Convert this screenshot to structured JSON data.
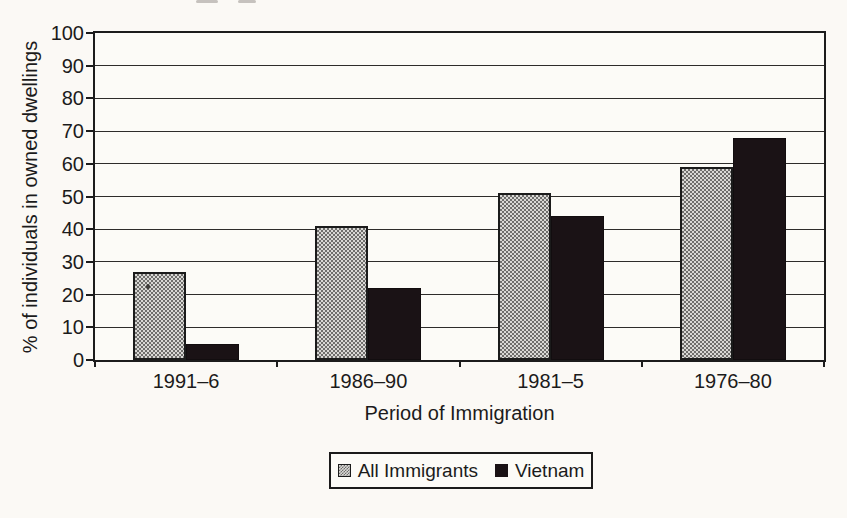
{
  "chart_data": {
    "type": "bar",
    "title": "",
    "categories": [
      "1991–6",
      "1986–90",
      "1981–5",
      "1976–80"
    ],
    "series": [
      {
        "name": "All Immigrants",
        "values": [
          27,
          41,
          51,
          59
        ],
        "style": "gray-checkerboard",
        "color": "#aaa8a5"
      },
      {
        "name": "Vietnam",
        "values": [
          5,
          22,
          44,
          68
        ],
        "style": "solid-black",
        "color": "#1a1215"
      }
    ],
    "xlabel": "Period of Immigration",
    "ylabel": "% of individuals in owned dwellings",
    "ylim": [
      0,
      100
    ],
    "ytick_step": 10,
    "ytick_labels": [
      "0",
      "10",
      "20",
      "30",
      "40",
      "50",
      "60",
      "70",
      "80",
      "90",
      "100"
    ],
    "grid": "horizontal",
    "legend_position": "bottom-center"
  },
  "colors": {
    "paper": "#fbf9f5",
    "line": "#1c1c1c",
    "text": "#1b1b1b"
  }
}
